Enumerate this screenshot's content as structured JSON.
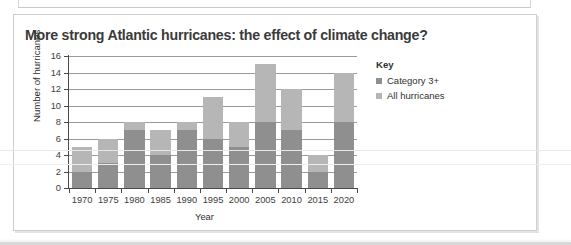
{
  "page": {
    "background": "#ffffff"
  },
  "figure": {
    "title": "More strong Atlantic hurricanes: the effect of climate change?",
    "border_color": "#cfcfcf"
  },
  "key": {
    "title": "Key",
    "items": [
      {
        "label": "Category 3+",
        "color": "#8f8f8f"
      },
      {
        "label": "All hurricanes",
        "color": "#b6b6b6"
      }
    ]
  },
  "chart_data": {
    "type": "bar",
    "title": "More strong Atlantic hurricanes: the effect of climate change?",
    "xlabel": "Year",
    "ylabel": "Number of hurricanes",
    "categories": [
      "1970",
      "1975",
      "1980",
      "1985",
      "1990",
      "1995",
      "2000",
      "2005",
      "2010",
      "2015",
      "2020"
    ],
    "series": [
      {
        "name": "Category 3+",
        "color": "#8f8f8f",
        "values": [
          2,
          3,
          7,
          4,
          7,
          6,
          5,
          8,
          7,
          2,
          8
        ]
      },
      {
        "name": "All hurricanes",
        "color": "#b6b6b6",
        "values": [
          5,
          6,
          8,
          7,
          8,
          11,
          8,
          15,
          12,
          4,
          14
        ]
      }
    ],
    "ylim": [
      0,
      16
    ],
    "yticks": [
      "0",
      "2",
      "4",
      "6",
      "8",
      "10",
      "12",
      "14",
      "16"
    ],
    "grid": true,
    "legend_position": "right",
    "stacked_overlay": true
  }
}
